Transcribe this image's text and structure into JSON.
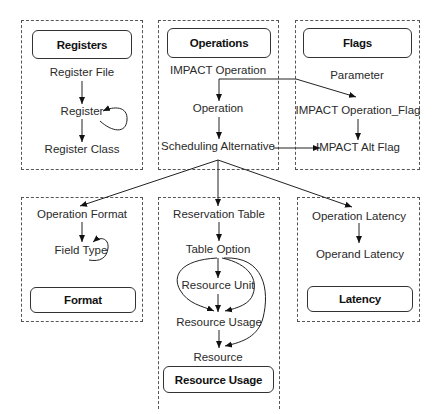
{
  "groups": {
    "registers": {
      "title": "Registers",
      "nodes": [
        "Register File",
        "Register",
        "Register Class"
      ]
    },
    "operations": {
      "title": "Operations",
      "nodes": [
        "IMPACT Operation",
        "Operation",
        "Scheduling Alternative"
      ]
    },
    "flags": {
      "title": "Flags",
      "nodes": [
        "Parameter",
        "IMPACT Operation_Flag",
        "IMPACT Alt Flag"
      ]
    },
    "format": {
      "title": "Format",
      "nodes": [
        "Operation Format",
        "Field Type"
      ]
    },
    "resource_usage": {
      "title": "Resource Usage",
      "nodes": [
        "Reservation Table",
        "Table Option",
        "Resource Unit",
        "Resource Usage",
        "Resource"
      ]
    },
    "latency": {
      "title": "Latency",
      "nodes": [
        "Operation Latency",
        "Operand Latency"
      ]
    }
  },
  "edges": [
    {
      "from": "Register File",
      "to": "Register"
    },
    {
      "from": "Register",
      "to": "Register",
      "type": "self-loop"
    },
    {
      "from": "Register",
      "to": "Register Class"
    },
    {
      "from": "IMPACT Operation",
      "to": "Operation"
    },
    {
      "from": "IMPACT Operation",
      "to": "IMPACT Operation_Flag"
    },
    {
      "from": "Operation",
      "to": "Scheduling Alternative"
    },
    {
      "from": "Scheduling Alternative",
      "to": "IMPACT Alt Flag"
    },
    {
      "from": "IMPACT Operation_Flag",
      "to": "IMPACT Alt Flag"
    },
    {
      "from": "Scheduling Alternative",
      "to": "Operation Format"
    },
    {
      "from": "Scheduling Alternative",
      "to": "Reservation Table"
    },
    {
      "from": "Scheduling Alternative",
      "to": "Operation Latency"
    },
    {
      "from": "Operation Format",
      "to": "Field Type"
    },
    {
      "from": "Field Type",
      "to": "Field Type",
      "type": "self-loop"
    },
    {
      "from": "Operation Latency",
      "to": "Operand Latency"
    },
    {
      "from": "Reservation Table",
      "to": "Table Option"
    },
    {
      "from": "Table Option",
      "to": "Resource Unit"
    },
    {
      "from": "Table Option",
      "to": "Resource Usage"
    },
    {
      "from": "Table Option",
      "to": "Resource"
    },
    {
      "from": "Resource Unit",
      "to": "Resource Usage"
    },
    {
      "from": "Resource Usage",
      "to": "Resource"
    }
  ]
}
